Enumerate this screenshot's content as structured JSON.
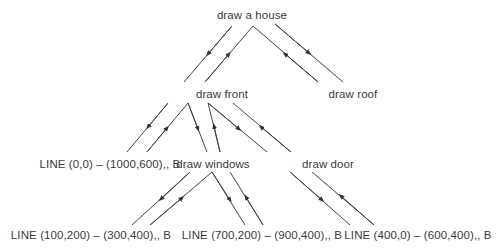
{
  "diagram": {
    "type": "tree",
    "title": "",
    "line_color": "#444444",
    "nodes": {
      "root": "draw a house",
      "front": "draw front",
      "roof": "draw roof",
      "outline": "LINE (0,0) – (1000,600),, B",
      "windows": "draw windows",
      "door": "draw door",
      "window1": "LINE (100,200) – (300,400),, B",
      "window2": "LINE (700,200) – (900,400),, B",
      "door_line": "LINE (400,0) – (600,400),, B"
    },
    "edges": [
      {
        "from": "draw a house",
        "to": "draw front",
        "directions": [
          "down",
          "up"
        ]
      },
      {
        "from": "draw a house",
        "to": "draw roof",
        "directions": [
          "up",
          "down"
        ]
      },
      {
        "from": "draw front",
        "to": "LINE (0,0) – (1000,600),, B",
        "directions": [
          "down",
          "up"
        ]
      },
      {
        "from": "draw front",
        "to": "draw windows",
        "directions": [
          "down",
          "up"
        ]
      },
      {
        "from": "draw front",
        "to": "draw door",
        "directions": [
          "down",
          "up"
        ]
      },
      {
        "from": "draw windows",
        "to": "LINE (100,200) – (300,400),, B",
        "directions": [
          "down",
          "up"
        ]
      },
      {
        "from": "draw windows",
        "to": "LINE (700,200) – (900,400),, B",
        "directions": [
          "down",
          "up"
        ]
      },
      {
        "from": "draw door",
        "to": "LINE (400,0) – (600,400),, B",
        "directions": [
          "down",
          "up"
        ]
      }
    ]
  }
}
